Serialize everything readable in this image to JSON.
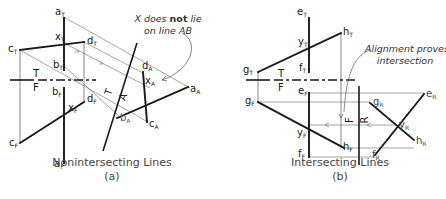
{
  "figure": {
    "panels": [
      {
        "id": "a",
        "caption": "Nonintersecting Lines",
        "sublabel": "(a)",
        "annotation": {
          "line1_pre": "X does ",
          "line1_bold": "not",
          "line1_post": " lie",
          "line2": "on line AB"
        },
        "fold_lines": {
          "tf_top": "T",
          "tf_bottom": "F",
          "ta_left": "T",
          "ta_right": "A"
        },
        "labels": {
          "aT": "a",
          "aT_sub": "T",
          "xT": "x",
          "xT_sub": "T",
          "dT": "d",
          "dT_sub": "T",
          "cT": "c",
          "cT_sub": "T",
          "bT": "b",
          "bT_sub": "T",
          "bF": "b",
          "bF_sub": "F",
          "dF": "d",
          "dF_sub": "F",
          "xF": "x",
          "xF_sub": "F",
          "cF": "c",
          "cF_sub": "F",
          "aF": "a",
          "aF_sub": "F",
          "dA": "d",
          "dA_sub": "A",
          "xA": "x",
          "xA_sub": "A",
          "aA": "a",
          "aA_sub": "A",
          "bA": "b",
          "bA_sub": "A",
          "cA": "c",
          "cA_sub": "A"
        }
      },
      {
        "id": "b",
        "caption": "Intersecting Lines",
        "sublabel": "(b)",
        "annotation": {
          "line1": "Alignment proves",
          "line2": "intersection"
        },
        "fold_lines": {
          "tf_top": "T",
          "tf_bottom": "F",
          "fr_left": "F",
          "fr_right": "R"
        },
        "labels": {
          "eT": "e",
          "eT_sub": "T",
          "hT": "h",
          "hT_sub": "T",
          "yT": "y",
          "yT_sub": "T",
          "gT": "g",
          "gT_sub": "T",
          "fT": "f",
          "fT_sub": "T",
          "eF": "e",
          "eF_sub": "F",
          "gF": "g",
          "gF_sub": "F",
          "yF": "y",
          "yF_sub": "F",
          "fF": "f",
          "fF_sub": "F",
          "hF": "h",
          "hF_sub": "F",
          "gR": "g",
          "gR_sub": "R",
          "eR": "e",
          "eR_sub": "R",
          "yR": "y",
          "yR_sub": "R",
          "hR": "h",
          "hR_sub": "R",
          "fR": "f",
          "fR_sub": "R"
        }
      }
    ]
  }
}
